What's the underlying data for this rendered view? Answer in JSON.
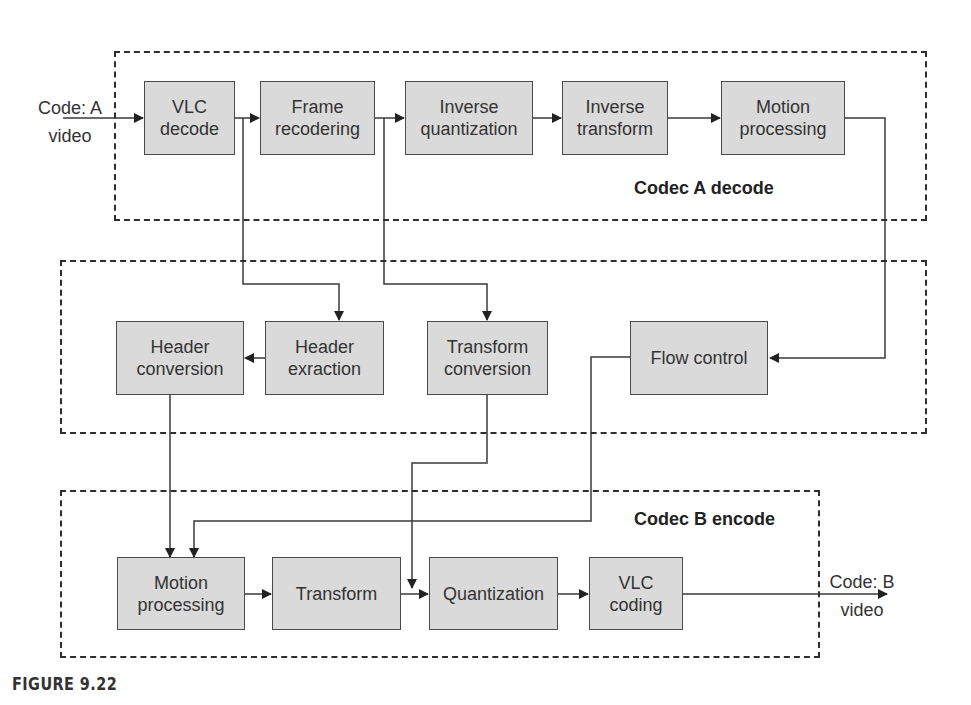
{
  "diagram": {
    "type": "block-flow",
    "caption": "FIGURE 9.22",
    "regions": [
      {
        "id": "codec-a-decode",
        "label": "Codec A decode"
      },
      {
        "id": "conversion",
        "label": ""
      },
      {
        "id": "codec-b-encode",
        "label": "Codec B encode"
      }
    ],
    "inputs": {
      "source": {
        "line1": "Code: A",
        "line2": "video"
      },
      "sink": {
        "line1": "Code: B",
        "line2": "video"
      }
    },
    "blocks": {
      "vlc_decode": {
        "line1": "VLC",
        "line2": "decode"
      },
      "frame_recodering": {
        "line1": "Frame",
        "line2": "recodering"
      },
      "inverse_quantization": {
        "line1": "Inverse",
        "line2": "quantization"
      },
      "inverse_transform": {
        "line1": "Inverse",
        "line2": "transform"
      },
      "motion_processing_a": {
        "line1": "Motion",
        "line2": "processing"
      },
      "header_conversion": {
        "line1": "Header",
        "line2": "conversion"
      },
      "header_exraction": {
        "line1": "Header",
        "line2": "exraction"
      },
      "transform_conversion": {
        "line1": "Transform",
        "line2": "conversion"
      },
      "flow_control": {
        "line1": "Flow control",
        "line2": ""
      },
      "motion_processing_b": {
        "line1": "Motion",
        "line2": "processing"
      },
      "transform": {
        "line1": "Transform",
        "line2": ""
      },
      "quantization": {
        "line1": "Quantization",
        "line2": ""
      },
      "vlc_coding": {
        "line1": "VLC",
        "line2": "coding"
      }
    },
    "edges": [
      [
        "Code: A video",
        "VLC decode"
      ],
      [
        "VLC decode",
        "Frame recodering"
      ],
      [
        "Frame recodering",
        "Inverse quantization"
      ],
      [
        "Inverse quantization",
        "Inverse transform"
      ],
      [
        "Inverse transform",
        "Motion processing (A)"
      ],
      [
        "VLC decode",
        "Header exraction"
      ],
      [
        "Frame recodering",
        "Transform conversion"
      ],
      [
        "Motion processing (A)",
        "Flow control"
      ],
      [
        "Header exraction",
        "Header conversion"
      ],
      [
        "Header conversion",
        "Motion processing (B)"
      ],
      [
        "Flow control",
        "Motion processing (B)"
      ],
      [
        "Transform conversion",
        "Quantization"
      ],
      [
        "Motion processing (B)",
        "Transform"
      ],
      [
        "Transform",
        "Quantization"
      ],
      [
        "Quantization",
        "VLC coding"
      ],
      [
        "VLC coding",
        "Code: B video"
      ]
    ]
  }
}
